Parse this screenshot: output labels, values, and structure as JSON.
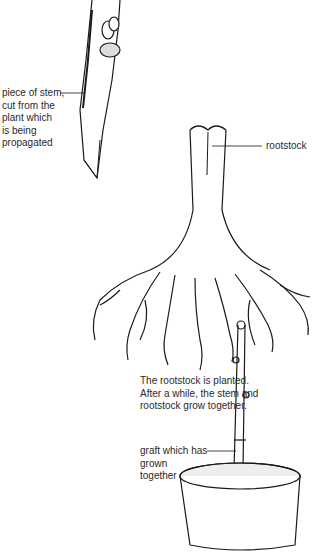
{
  "diagram": {
    "labels": {
      "stem_piece": [
        "piece of stem,",
        "cut from the",
        "plant which",
        "is being",
        "propagated"
      ],
      "rootstock": "rootstock",
      "planted_caption": [
        "The rootstock is planted.",
        "After a while, the stem and",
        "rootstock grow together."
      ],
      "graft": [
        "graft which has",
        "grown",
        "together"
      ]
    },
    "colors": {
      "ink": "#1a1a1a",
      "background": "#ffffff"
    }
  }
}
